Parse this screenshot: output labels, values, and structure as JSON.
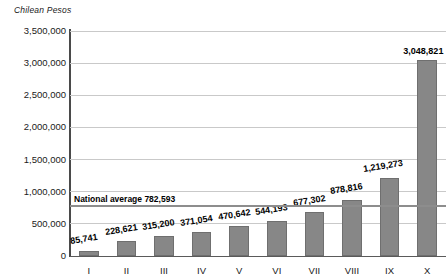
{
  "chart_data": {
    "type": "bar",
    "title": "",
    "ylabel": "Chilean Pesos",
    "xlabel": "",
    "categories": [
      "I",
      "II",
      "III",
      "IV",
      "V",
      "VI",
      "VII",
      "VIII",
      "IX",
      "X"
    ],
    "values": [
      85741,
      228621,
      315200,
      371054,
      470642,
      544193,
      677302,
      878816,
      1219273,
      3048821
    ],
    "value_labels": [
      "85,741",
      "228,621",
      "315,200",
      "371,054",
      "470,642",
      "544,193",
      "677,302",
      "878,816",
      "1,219,273",
      "3,048,821"
    ],
    "ylim": [
      0,
      3500000
    ],
    "ytick_values": [
      0,
      500000,
      1000000,
      1500000,
      2000000,
      2500000,
      3000000,
      3500000
    ],
    "ytick_labels": [
      "0",
      "500,000",
      "1,000,000",
      "1,500,000",
      "2,000,000",
      "2,500,000",
      "3,000,000",
      "3,500,000"
    ],
    "grid": true,
    "legend": false,
    "annotations": [
      {
        "name": "national-average",
        "label": "National average 782,593",
        "value": 782593
      }
    ],
    "colors": {
      "bar_fill": "#878787",
      "bar_edge": "#6f6f6f",
      "gridline": "#c9c9c9",
      "axis": "#4a4a4a",
      "average_line": "#8d8d8d",
      "text": "#111111",
      "background": "#ffffff"
    }
  }
}
